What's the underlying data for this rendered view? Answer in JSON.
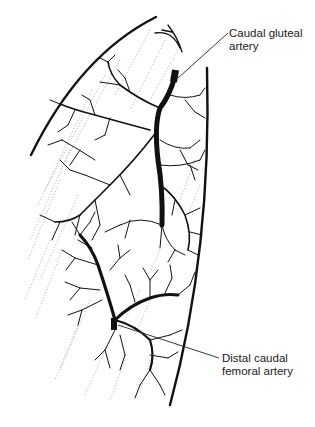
{
  "diagram": {
    "colors": {
      "ink": "#111111",
      "stipple": "#9a9a9a",
      "background": "#ffffff"
    },
    "labels": [
      {
        "id": "caudal-gluteal",
        "line1": "Caudal gluteal",
        "line2": "artery",
        "leader_from": [
          228,
          33
        ],
        "leader_to": [
          178,
          78
        ]
      },
      {
        "id": "distal-caudal-femoral",
        "line1": "Distal caudal",
        "line2": "femoral artery",
        "leader_from": [
          219,
          358
        ],
        "leader_to": [
          118,
          325
        ]
      }
    ]
  }
}
